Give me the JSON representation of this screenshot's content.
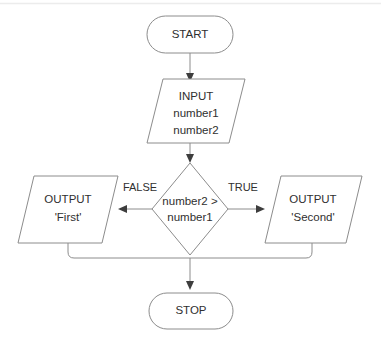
{
  "diagram": {
    "type": "flowchart",
    "stroke_color": "#8c8c8c",
    "text_color": "#2f2f2f",
    "background_color": "#ffffff",
    "nodes": [
      {
        "id": "start",
        "shape": "terminator",
        "lines": [
          "START"
        ],
        "line1": "START"
      },
      {
        "id": "input",
        "shape": "parallelogram",
        "lines": [
          "INPUT",
          "number1",
          "number2"
        ],
        "line1": "INPUT",
        "line2": "number1",
        "line3": "number2"
      },
      {
        "id": "decision",
        "shape": "diamond",
        "lines": [
          "number2 >",
          "number1"
        ],
        "line1": "number2 >",
        "line2": "number1"
      },
      {
        "id": "output_false",
        "shape": "parallelogram",
        "lines": [
          "OUTPUT",
          "'First'"
        ],
        "line1": "OUTPUT",
        "line2": "'First'"
      },
      {
        "id": "output_true",
        "shape": "parallelogram",
        "lines": [
          "OUTPUT",
          "'Second'"
        ],
        "line1": "OUTPUT",
        "line2": "'Second'"
      },
      {
        "id": "stop",
        "shape": "terminator",
        "lines": [
          "STOP"
        ],
        "line1": "STOP"
      }
    ],
    "edge_labels": {
      "false_branch": "FALSE",
      "true_branch": "TRUE"
    }
  }
}
